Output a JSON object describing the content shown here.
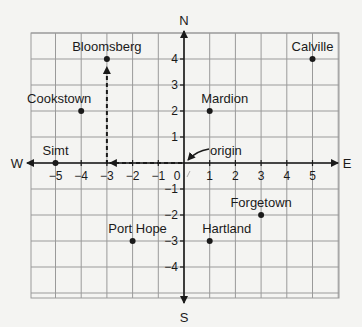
{
  "geometry": {
    "origin_x": 184,
    "origin_y": 163,
    "unit_x": 25.7,
    "unit_y": 26,
    "grid_left": 31,
    "grid_right": 339,
    "grid_top": 33,
    "grid_bottom": 298
  },
  "compass": {
    "north": "N",
    "south": "S",
    "east": "E",
    "west": "W"
  },
  "x_ticks": [
    "-5",
    "-4",
    "-3",
    "-2",
    "-1",
    "0",
    "1",
    "2",
    "3",
    "4",
    "5"
  ],
  "x_tick_values": [
    -5,
    -4,
    -3,
    -2,
    -1,
    0,
    1,
    2,
    3,
    4,
    5
  ],
  "y_ticks": [
    "4",
    "3",
    "2",
    "1",
    "-1",
    "-2",
    "-3",
    "-4"
  ],
  "y_tick_values": [
    4,
    3,
    2,
    1,
    -1,
    -2,
    -3,
    -4
  ],
  "origin_label": "origin",
  "places": [
    {
      "name": "Bloomsberg",
      "x": -3,
      "y": 4
    },
    {
      "name": "Calville",
      "x": 5,
      "y": 4
    },
    {
      "name": "Cookstown",
      "x": -4,
      "y": 2
    },
    {
      "name": "Mardion",
      "x": 1,
      "y": 2
    },
    {
      "name": "Simt",
      "x": -5,
      "y": 0
    },
    {
      "name": "Forgetown",
      "x": 3,
      "y": -2
    },
    {
      "name": "Port Hope",
      "x": -2,
      "y": -3
    },
    {
      "name": "Hartland",
      "x": 1,
      "y": -3
    }
  ],
  "path": {
    "description": "dashed path from origin west to (-3,0) then north to Bloomsberg (-3,4)",
    "points": [
      [
        0,
        0
      ],
      [
        -3,
        0
      ],
      [
        -3,
        4
      ]
    ]
  },
  "colors": {
    "ink": "#1a1a1a",
    "grid": "#9a9a9a",
    "paper": "#f4f4f2"
  }
}
